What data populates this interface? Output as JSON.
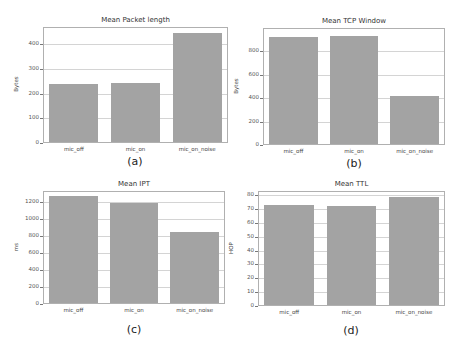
{
  "chart_data": [
    {
      "id": "a",
      "type": "bar",
      "title": "Mean Packet length",
      "xlabel": "",
      "ylabel": "Bytes",
      "caption": "(a)",
      "categories": [
        "mic_off",
        "mic_on",
        "mic_on_noise"
      ],
      "values": [
        241,
        245,
        445
      ],
      "ylim": [
        0,
        470
      ],
      "yticks": [
        0,
        100,
        200,
        300,
        400
      ],
      "grid": true,
      "bar_color": "#a3a3a3"
    },
    {
      "id": "b",
      "type": "bar",
      "title": "Mean TCP Window",
      "xlabel": "",
      "ylabel": "Bytes",
      "caption": "(b)",
      "categories": [
        "mic_off",
        "mic_on",
        "mic_on_noise"
      ],
      "values": [
        920,
        935,
        420
      ],
      "ylim": [
        0,
        1000
      ],
      "yticks": [
        0,
        200,
        400,
        600,
        800
      ],
      "grid": true,
      "bar_color": "#a3a3a3"
    },
    {
      "id": "c",
      "type": "bar",
      "title": "Mean IPT",
      "xlabel": "",
      "ylabel": "ms",
      "caption": "(c)",
      "categories": [
        "mic_off",
        "mic_on",
        "mic_on_noise"
      ],
      "values": [
        1270,
        1190,
        850
      ],
      "ylim": [
        0,
        1330
      ],
      "yticks": [
        0,
        200,
        400,
        600,
        800,
        1000,
        1200
      ],
      "grid": true,
      "bar_color": "#a3a3a3"
    },
    {
      "id": "d",
      "type": "bar",
      "title": "Mean TTL",
      "xlabel": "",
      "ylabel": "HOP",
      "caption": "(d)",
      "categories": [
        "mic_off",
        "mic_on",
        "mic_on_noise"
      ],
      "values": [
        72.7,
        72.5,
        79
      ],
      "ylim": [
        0,
        83
      ],
      "yticks": [
        0,
        10,
        20,
        30,
        40,
        50,
        60,
        70,
        80
      ],
      "grid": true,
      "bar_color": "#a3a3a3"
    }
  ]
}
